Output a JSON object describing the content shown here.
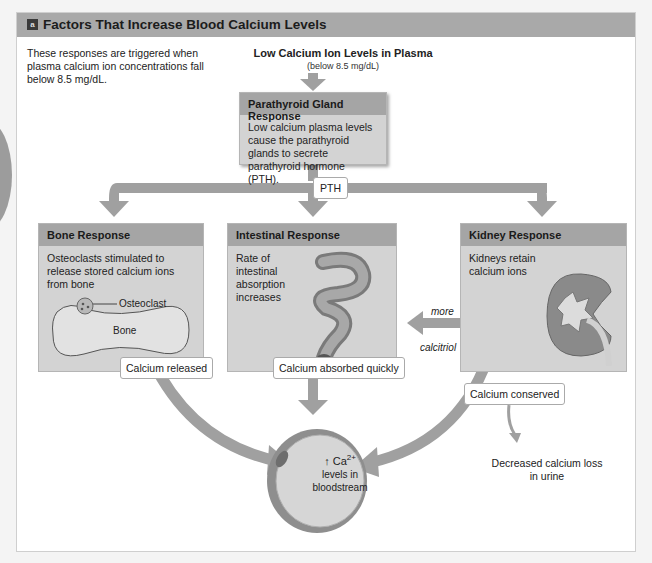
{
  "figure": {
    "panel_letter": "a",
    "title": "Factors That Increase Blood Calcium Levels",
    "intro_text": "These responses are triggered when plasma calcium ion concentrations fall below 8.5 mg/dL.",
    "trigger": {
      "title": "Low Calcium Ion Levels in Plasma",
      "subtitle": "(below 8.5 mg/dL)"
    },
    "parathyroid": {
      "title": "Parathyroid Gland Response",
      "body": "Low calcium plasma levels cause the parathyroid glands to secrete parathyroid hormone (PTH)."
    },
    "hormone_label": "PTH",
    "responses": [
      {
        "title": "Bone Response",
        "body": "Osteoclasts stimulated to release stored calcium ions from bone",
        "labels": [
          "Osteoclast",
          "Bone"
        ],
        "outcome": "Calcium released"
      },
      {
        "title": "Intestinal Response",
        "body": "Rate of intestinal absorption increases",
        "outcome": "Calcium absorbed quickly"
      },
      {
        "title": "Kidney Response",
        "body": "Kidneys retain calcium ions",
        "outcome": "Calcium conserved"
      }
    ],
    "calcitriol_arrow": {
      "top": "more",
      "bottom": "calcitriol"
    },
    "urine_note": "Decreased calcium loss in urine",
    "result": {
      "arrow": "↑",
      "ion": "Ca",
      "charge": "2+",
      "text": "levels in bloodstream"
    },
    "colors": {
      "header": "#a9a9a9",
      "box_fill": "#d3d3d3",
      "box_header": "#a5a5a5",
      "arrow": "#a0a0a0",
      "kidney": "#8a8a8a",
      "background": "#ffffff"
    }
  }
}
